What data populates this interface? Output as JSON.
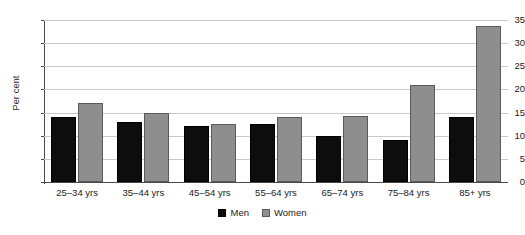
{
  "chart_data": {
    "type": "bar",
    "title": "",
    "subtitle": "",
    "xlabel": "",
    "ylabel": "Per cent",
    "categories": [
      "25–34 yrs",
      "35–44 yrs",
      "45–54 yrs",
      "55–64 yrs",
      "65–74 yrs",
      "75–84 yrs",
      "85+ yrs"
    ],
    "series": [
      {
        "name": "Men",
        "color": "#0d0d0d",
        "values": [
          14.0,
          13.0,
          12.0,
          12.6,
          10.0,
          9.0,
          14.0
        ]
      },
      {
        "name": "Women",
        "color": "#8e8e8e",
        "values": [
          17.0,
          15.0,
          12.5,
          14.0,
          14.3,
          21.0,
          33.7
        ]
      }
    ],
    "ylim": [
      0,
      35
    ],
    "yticks": [
      0,
      5,
      10,
      15,
      20,
      25,
      30,
      35
    ],
    "ytick_labels": [
      "0",
      "5",
      "10",
      "15",
      "20",
      "25",
      "30",
      "35"
    ],
    "grid": true,
    "grid_axis": "y",
    "legend_position": "bottom-center",
    "legend_entries": [
      "Men",
      "Women"
    ]
  }
}
